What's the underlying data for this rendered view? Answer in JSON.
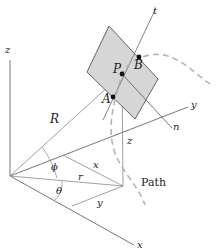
{
  "diagram": {
    "labels": {
      "z_axis": "z",
      "y_axis": "y",
      "x_axis": "x",
      "R": "R",
      "phi": "ϕ",
      "theta": "θ",
      "r": "r",
      "x_comp": "x",
      "y_comp": "y",
      "z_comp": "z",
      "P": "P",
      "A": "A",
      "B": "B",
      "t": "t",
      "n": "n",
      "path": "Path"
    },
    "colors": {
      "plane_fill": "#d6d6d6",
      "plane_stroke": "#555555",
      "line": "#777777",
      "axis": "#555555",
      "path_dash": "#b5b5b5",
      "point": "#111111"
    }
  }
}
